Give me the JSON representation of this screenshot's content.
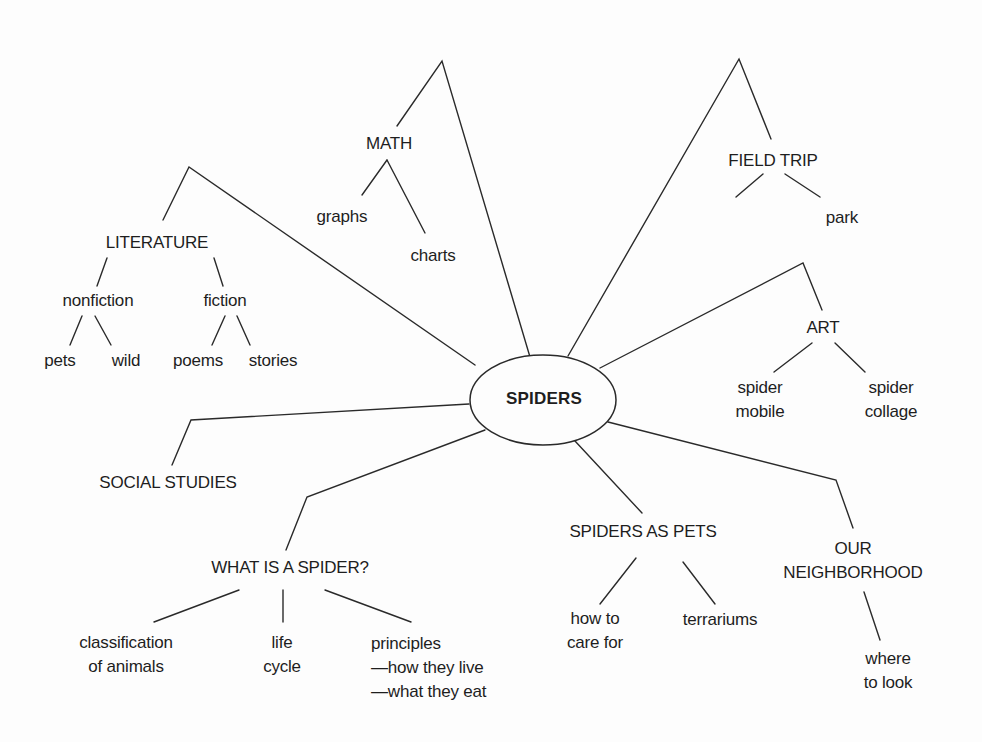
{
  "diagram": {
    "type": "concept-map",
    "center": {
      "label": "SPIDERS"
    },
    "branches": [
      {
        "id": "math",
        "label": "MATH",
        "children": [
          {
            "label": "graphs"
          },
          {
            "label": "charts"
          }
        ]
      },
      {
        "id": "field-trip",
        "label": "FIELD TRIP",
        "children": [
          {
            "label": "pet shop"
          },
          {
            "label": "park"
          }
        ]
      },
      {
        "id": "literature",
        "label": "LITERATURE",
        "children": [
          {
            "label": "nonfiction",
            "children": [
              {
                "label": "pets"
              },
              {
                "label": "wild"
              }
            ]
          },
          {
            "label": "fiction",
            "children": [
              {
                "label": "poems"
              },
              {
                "label": "stories"
              }
            ]
          }
        ]
      },
      {
        "id": "art",
        "label": "ART",
        "children": [
          {
            "line1": "spider",
            "line2": "mobile"
          },
          {
            "line1": "spider",
            "line2": "collage"
          }
        ]
      },
      {
        "id": "social-studies",
        "label": "SOCIAL STUDIES",
        "children": []
      },
      {
        "id": "what-is-a-spider",
        "label": "WHAT IS A SPIDER?",
        "children": [
          {
            "line1": "classification",
            "line2": "of animals"
          },
          {
            "line1": "life",
            "line2": "cycle"
          },
          {
            "line1": "principles",
            "line2": "—how they live",
            "line3": "—what they eat"
          }
        ]
      },
      {
        "id": "spiders-as-pets",
        "label": "SPIDERS AS PETS",
        "children": [
          {
            "line1": "how to",
            "line2": "care for"
          },
          {
            "label": "terrariums"
          }
        ]
      },
      {
        "id": "our-neighborhood",
        "line1": "OUR",
        "line2": "NEIGHBORHOOD",
        "children": [
          {
            "line1": "where",
            "line2": "to look"
          }
        ]
      }
    ]
  },
  "colors": {
    "ink": "#1e1e1e",
    "line": "#2a2a2a",
    "background": "#fdfdfd"
  }
}
